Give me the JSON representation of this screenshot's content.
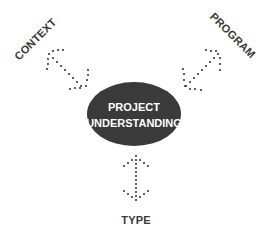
{
  "diagram": {
    "center": {
      "line1": "PROJECT",
      "line2": "UNDERSTANDING",
      "fill": "#3a3a3a",
      "text_color": "#ffffff"
    },
    "nodes": [
      {
        "id": "context",
        "label": "CONTEXT",
        "position": "top-left"
      },
      {
        "id": "program",
        "label": "PROGRAM",
        "position": "top-right"
      },
      {
        "id": "type",
        "label": "TYPE",
        "position": "bottom"
      }
    ],
    "connector_style": "dotted double-headed arrow",
    "colors": {
      "ink": "#3a3a3a",
      "background": "#ffffff"
    }
  }
}
